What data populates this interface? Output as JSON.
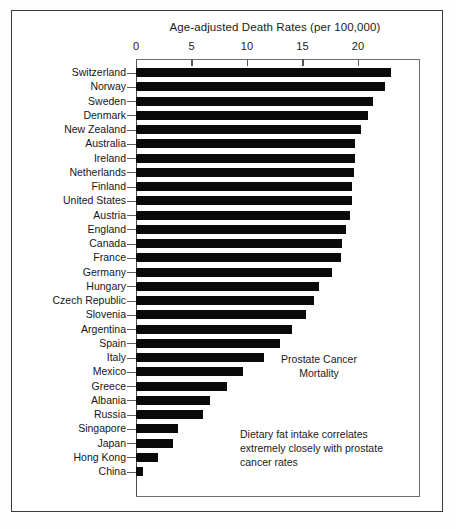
{
  "chart_data": {
    "type": "bar",
    "orientation": "horizontal",
    "title": "Age-adjusted Death Rates (per 100,000)",
    "xlabel": "",
    "ylabel": "",
    "xlim": [
      0,
      25.5
    ],
    "grid": false,
    "legend": null,
    "xticks": [
      0,
      5,
      10,
      15,
      20
    ],
    "xtick_labels": [
      "0",
      "5",
      "10",
      "15",
      "20"
    ],
    "categories": [
      "Switzerland",
      "Norway",
      "Sweden",
      "Denmark",
      "New Zealand",
      "Australia",
      "Ireland",
      "Netherlands",
      "Finland",
      "United States",
      "Austria",
      "England",
      "Canada",
      "France",
      "Germany",
      "Hungary",
      "Czech Republic",
      "Slovenia",
      "Argentina",
      "Spain",
      "Italy",
      "Mexico",
      "Greece",
      "Albania",
      "Russia",
      "Singapore",
      "Japan",
      "Hong Kong",
      "China"
    ],
    "values": [
      23.0,
      22.4,
      21.4,
      20.9,
      20.3,
      19.7,
      19.7,
      19.6,
      19.5,
      19.5,
      19.3,
      18.9,
      18.6,
      18.5,
      17.7,
      16.5,
      16.0,
      15.3,
      14.1,
      13.0,
      11.5,
      9.6,
      8.2,
      6.7,
      6.0,
      3.8,
      3.3,
      2.0,
      0.6
    ],
    "bar_color": "#0a0a0a",
    "annotations": [
      {
        "name": "prostate-cancer-mortality",
        "text": "Prostate Cancer\nMortality"
      },
      {
        "name": "dietary-fat-note",
        "text": "Dietary fat intake correlates\nextremely closely with prostate\ncancer rates"
      }
    ]
  }
}
